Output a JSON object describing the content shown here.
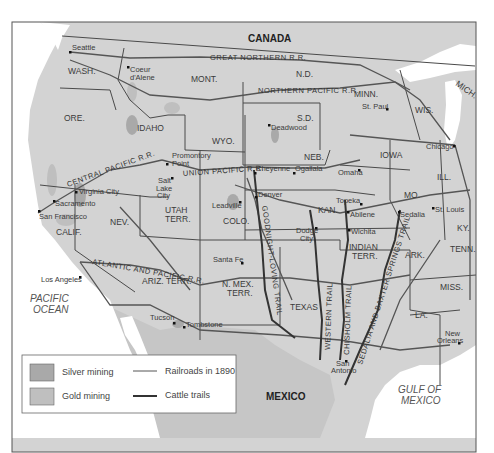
{
  "colors": {
    "land": "#d3d3d3",
    "mexico": "#c6c6c6",
    "water": "#ffffff",
    "border": "#4a4a4a",
    "railroad": "#555555",
    "trail": "#333333",
    "silver": "#a9a9a9",
    "gold": "#bfbfbf"
  },
  "countries": [
    "CANADA",
    "MEXICO"
  ],
  "water_bodies": [
    "PACIFIC OCEAN",
    "GULF OF MEXICO"
  ],
  "water_labels": {
    "pacific_1": "PACIFIC",
    "pacific_2": "OCEAN",
    "gulf_1": "GULF OF",
    "gulf_2": "MEXICO"
  },
  "states": {
    "wash": "WASH.",
    "ore": "ORE.",
    "calif": "CALIF.",
    "idaho": "IDAHO",
    "nev": "NEV.",
    "mont": "MONT.",
    "wyo": "WYO.",
    "utah_1": "UTAH",
    "utah_2": "TERR.",
    "colo": "COLO.",
    "ariz": "ARIZ. TERR.",
    "nmex_1": "N. MEX.",
    "nmex_2": "TERR.",
    "nd": "N.D.",
    "sd": "S.D.",
    "neb": "NEB.",
    "kan": "KAN.",
    "texas": "TEXAS",
    "indian_1": "INDIAN",
    "indian_2": "TERR.",
    "minn": "MINN.",
    "iowa": "IOWA",
    "mo": "MO.",
    "ark": "ARK.",
    "la": "LA.",
    "wis": "WIS.",
    "ill": "ILL.",
    "mich": "MICH.",
    "ky": "KY.",
    "tenn": "TENN.",
    "miss": "MISS."
  },
  "cities": {
    "seattle": "Seattle",
    "coeur_1": "Coeur",
    "coeur_2": "d'Alene",
    "deadwood": "Deadwood",
    "st_paul": "St. Paul",
    "chicago": "Chicago",
    "promontory_1": "Promontory",
    "promontory_2": "Point",
    "slc_1": "Salt",
    "slc_2": "Lake",
    "slc_3": "City",
    "cheyenne": "Cheyenne",
    "ogallala": "Ogallala",
    "omaha": "Omaha",
    "virginia_city": "Virginia City",
    "sacramento": "Sacramento",
    "san_francisco": "San Francisco",
    "leadville": "Leadville",
    "denver": "Denver",
    "topeka": "Topeka",
    "abilene": "Abilene",
    "sedalia": "Sedalia",
    "st_louis": "St. Louis",
    "dodge_1": "Dodge",
    "dodge_2": "City",
    "wichita": "Wichita",
    "santa_fe": "Santa Fe",
    "los_angeles": "Los Angeles",
    "tucson": "Tucson",
    "tombstone": "Tombstone",
    "san_antonio_1": "San",
    "san_antonio_2": "Antonio",
    "new_orleans_1": "New",
    "new_orleans_2": "Orleans"
  },
  "railroads": {
    "great_northern": "GREAT NORTHERN R.R.",
    "northern_pacific": "NORTHERN PACIFIC R.R.",
    "central_pacific": "CENTRAL PACIFIC R.R.",
    "union_pacific": "UNION PACIFIC R.R.",
    "atlantic_pacific": "ATLANTIC AND PACIFIC R.R."
  },
  "trails": {
    "goodnight_loving": "GOODNIGHT-LOVING TRAIL",
    "western": "WESTERN TRAIL",
    "chisholm": "CHISHOLM TRAIL",
    "sedalia_baxter": "SEDALIA AND BAXTER SPRINGS TRAIL"
  },
  "legend": {
    "silver": "Silver mining",
    "gold": "Gold mining",
    "railroads": "Railroads in 1890",
    "cattle": "Cattle trails"
  }
}
